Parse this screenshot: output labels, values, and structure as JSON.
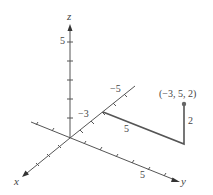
{
  "diagram": {
    "title": "",
    "axes": {
      "x": {
        "label": "x"
      },
      "y": {
        "label": "y",
        "tick_label": "5"
      },
      "z": {
        "label": "z",
        "tick_label": "5"
      },
      "neg_x": {
        "tick_labels": [
          "-3",
          "-5"
        ]
      }
    },
    "path": {
      "segment_labels": [
        "5",
        "2"
      ],
      "color": "#555555"
    },
    "point": {
      "label": "(−3, 5, 2)",
      "coords": [
        -3,
        5,
        2
      ],
      "color": "#666666"
    },
    "labels": {
      "z_axis": "z",
      "z_five": "5",
      "neg_three": "−3",
      "neg_five": "−5",
      "path_five": "5",
      "path_two": "2",
      "y_five": "5",
      "x_axis": "x",
      "y_axis": "y",
      "point": "(−3, 5, 2)"
    }
  }
}
